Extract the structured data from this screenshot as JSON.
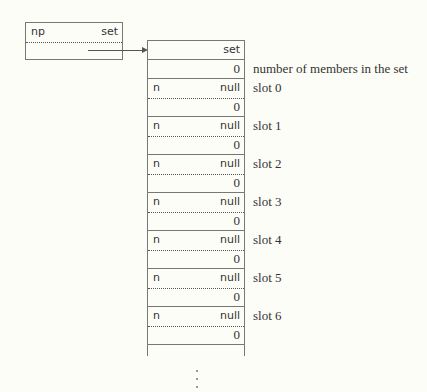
{
  "pointer": {
    "left_label": "np",
    "right_label": "set"
  },
  "set_struct": {
    "header": "set",
    "count_value": "0",
    "count_label": "number of members in the set"
  },
  "slots": [
    {
      "name": "n",
      "next": "null",
      "value": "0",
      "label": "slot 0"
    },
    {
      "name": "n",
      "next": "null",
      "value": "0",
      "label": "slot 1"
    },
    {
      "name": "n",
      "next": "null",
      "value": "0",
      "label": "slot 2"
    },
    {
      "name": "n",
      "next": "null",
      "value": "0",
      "label": "slot 3"
    },
    {
      "name": "n",
      "next": "null",
      "value": "0",
      "label": "slot 4"
    },
    {
      "name": "n",
      "next": "null",
      "value": "0",
      "label": "slot 5"
    },
    {
      "name": "n",
      "next": "null",
      "value": "0",
      "label": "slot 6"
    }
  ],
  "continuation": "⋮"
}
